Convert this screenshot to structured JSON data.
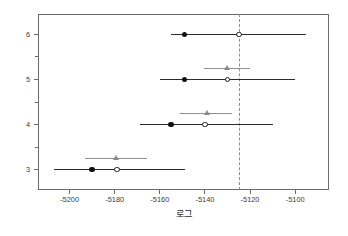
{
  "chart_data": {
    "type": "scatter",
    "title": "",
    "subtitle": "",
    "xlabel": "로그",
    "ylabel": "",
    "xlim": [
      -5214,
      -5085
    ],
    "ylim": [
      2.55,
      6.45
    ],
    "grid": false,
    "legend": "none",
    "orientation": "horizontal",
    "xticks": [
      -5200,
      -5180,
      -5160,
      -5140,
      -5120,
      -5100
    ],
    "xtick_labels": [
      "-5200",
      "-5180",
      "-5160",
      "-5140",
      "-5120",
      "-5100"
    ],
    "yticks": [
      3,
      4,
      5,
      6
    ],
    "ytick_labels": [
      "3",
      "4",
      "5",
      "6"
    ],
    "yminor_ticks": [
      3.5,
      4.5,
      5.5
    ],
    "reference_line": {
      "x": -5125,
      "style": "dashed",
      "color": "#8d8d8d",
      "orientation": "vertical"
    },
    "colors": {
      "primary_marker": "#111111",
      "open_marker_edge": "#1a1a1a",
      "secondary_marker": "#8a8a8a",
      "error_bar": "#2d2d2d",
      "secondary_error_bar": "#8e8e8e",
      "axis": "#6b6b6b",
      "reference": "#8d8d8d",
      "background": "#ffffff"
    },
    "series": [
      {
        "name": "filled-circle",
        "marker": "filled-circle",
        "categories": [
          3,
          4,
          5,
          6
        ],
        "values": [
          -5190,
          -5155,
          -5149,
          -5149
        ]
      },
      {
        "name": "open-circle",
        "marker": "open-circle",
        "categories": [
          3,
          4,
          5,
          6
        ],
        "values": [
          -5179,
          -5140,
          -5130,
          -5125
        ]
      },
      {
        "name": "triangle",
        "marker": "filled-triangle",
        "categories": [
          3,
          4,
          5
        ],
        "values": [
          -5179,
          -5139,
          -5130
        ]
      }
    ],
    "points": [
      {
        "y": 6,
        "y_label": "6",
        "filled_circle": -5149,
        "open_circle": -5125,
        "error_low": -5155,
        "error_high": -5095,
        "triangle": null,
        "triangle_error_low": null,
        "triangle_error_high": null
      },
      {
        "y": 5,
        "y_label": "5",
        "filled_circle": -5149,
        "open_circle": -5130,
        "error_low": -5160,
        "error_high": -5100,
        "triangle": -5130,
        "triangle_error_low": -5134,
        "triangle_error_high": -5126
      },
      {
        "y": 4,
        "y_label": "4",
        "filled_circle": -5155,
        "open_circle": -5140,
        "error_low": -5169,
        "error_high": -5110,
        "triangle": -5139,
        "triangle_error_low": -5145,
        "triangle_error_high": -5134
      },
      {
        "y": 3,
        "y_label": "3",
        "filled_circle": -5190,
        "open_circle": -5179,
        "error_low": -5207,
        "error_high": -5149,
        "triangle": -5179,
        "triangle_error_low": -5187,
        "triangle_error_high": -5172
      }
    ]
  }
}
